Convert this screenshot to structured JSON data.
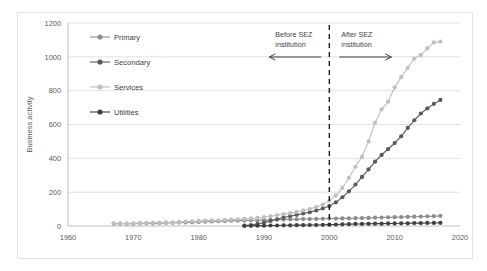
{
  "chart_data": {
    "type": "line",
    "title": "",
    "xlabel": "",
    "ylabel": "Business activity",
    "xlim": [
      1960,
      2020
    ],
    "ylim": [
      0,
      1200
    ],
    "xticks": [
      1960,
      1970,
      1980,
      1990,
      2000,
      2010,
      2020
    ],
    "yticks": [
      0,
      200,
      400,
      600,
      800,
      1000,
      1200
    ],
    "grid": "horizontal",
    "legend_position": "upper-left-inside",
    "x": [
      1967,
      1968,
      1969,
      1970,
      1971,
      1972,
      1973,
      1974,
      1975,
      1976,
      1977,
      1978,
      1979,
      1980,
      1981,
      1982,
      1983,
      1984,
      1985,
      1986,
      1987,
      1988,
      1989,
      1990,
      1991,
      1992,
      1993,
      1994,
      1995,
      1996,
      1997,
      1998,
      1999,
      2000,
      2001,
      2002,
      2003,
      2004,
      2005,
      2006,
      2007,
      2008,
      2009,
      2010,
      2011,
      2012,
      2013,
      2014,
      2015,
      2016,
      2017
    ],
    "series": [
      {
        "name": "Primary",
        "color": "#8c8c8c",
        "values": [
          14,
          14,
          13,
          14,
          15,
          16,
          16,
          17,
          18,
          19,
          20,
          21,
          22,
          24,
          25,
          27,
          28,
          29,
          31,
          32,
          33,
          34,
          34,
          35,
          36,
          37,
          38,
          39,
          40,
          41,
          41,
          42,
          43,
          44,
          44,
          45,
          45,
          46,
          47,
          48,
          49,
          50,
          51,
          52,
          53,
          54,
          55,
          56,
          57,
          58,
          60
        ]
      },
      {
        "name": "Secondary",
        "color": "#595959",
        "values": [
          null,
          null,
          null,
          null,
          null,
          null,
          null,
          null,
          null,
          null,
          null,
          null,
          null,
          null,
          null,
          null,
          null,
          null,
          null,
          null,
          2,
          6,
          12,
          20,
          30,
          40,
          50,
          58,
          66,
          74,
          82,
          92,
          104,
          118,
          140,
          170,
          205,
          245,
          290,
          335,
          380,
          420,
          455,
          490,
          530,
          580,
          625,
          665,
          695,
          722,
          745
        ]
      },
      {
        "name": "Services",
        "color": "#bfbfbf",
        "values": [
          16,
          15,
          15,
          16,
          17,
          18,
          19,
          20,
          21,
          22,
          24,
          26,
          28,
          30,
          32,
          33,
          34,
          36,
          38,
          40,
          42,
          45,
          48,
          52,
          58,
          64,
          70,
          76,
          84,
          92,
          100,
          112,
          126,
          150,
          180,
          225,
          285,
          350,
          410,
          500,
          610,
          690,
          735,
          820,
          880,
          935,
          990,
          1010,
          1050,
          1085,
          1090
        ]
      },
      {
        "name": "Utilities",
        "color": "#404040",
        "values": [
          null,
          null,
          null,
          null,
          null,
          null,
          null,
          null,
          null,
          null,
          null,
          null,
          null,
          null,
          null,
          null,
          null,
          null,
          null,
          null,
          1,
          1,
          2,
          2,
          3,
          3,
          4,
          4,
          5,
          5,
          6,
          6,
          7,
          8,
          9,
          10,
          11,
          12,
          12,
          13,
          14,
          14,
          15,
          15,
          16,
          16,
          17,
          17,
          18,
          18,
          19
        ]
      }
    ],
    "annotations": [
      {
        "name": "before-sez",
        "line1": "Before SEZ",
        "line2": "institution",
        "arrow": "left"
      },
      {
        "name": "after-sez",
        "line1": "After SEZ",
        "line2": "institution",
        "arrow": "right"
      }
    ],
    "reference_line": {
      "x": 2000,
      "style": "dashed",
      "color": "#1a1a1a"
    }
  }
}
